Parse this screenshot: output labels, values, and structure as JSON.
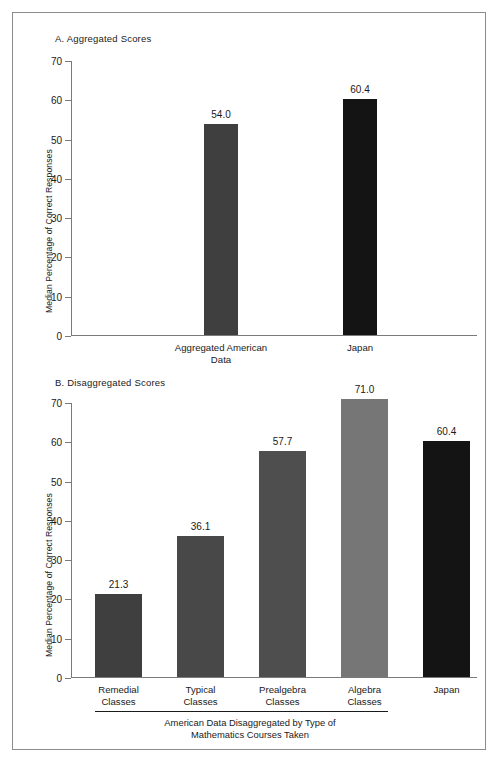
{
  "figure": {
    "border_color": "#8c8c8c",
    "axis_color": "#7a7a7a"
  },
  "chart_data": [
    {
      "type": "bar",
      "title": "A. Aggregated Scores",
      "xlabel": "",
      "ylabel": "Median Percentage of Correct Responses",
      "ylim": [
        0,
        70
      ],
      "yticks": [
        0,
        10,
        20,
        30,
        40,
        50,
        60,
        70
      ],
      "ytick_labels": [
        "0",
        "10",
        "20",
        "30",
        "40",
        "50",
        "60",
        "70"
      ],
      "grid": false,
      "legend": "none",
      "categories": [
        "Aggregated American Data",
        "Japan"
      ],
      "category_lines": [
        [
          "Aggregated American",
          "Data"
        ],
        [
          "Japan"
        ]
      ],
      "values": [
        54.0,
        60.4
      ],
      "value_labels": [
        "54.0",
        "60.4"
      ],
      "bar_colors": [
        "#3f3f3f",
        "#141414"
      ]
    },
    {
      "type": "bar",
      "title": "B. Disaggregated Scores",
      "xlabel": "American Data Disaggregated by Type of Mathematics Courses Taken",
      "xlabel_lines": [
        "American Data Disaggregated by Type of",
        "Mathematics Courses Taken"
      ],
      "ylabel": "Median Percentage of Correct Responses",
      "ylim": [
        0,
        70
      ],
      "yticks": [
        0,
        10,
        20,
        30,
        40,
        50,
        60,
        70
      ],
      "ytick_labels": [
        "0",
        "10",
        "20",
        "30",
        "40",
        "50",
        "60",
        "70"
      ],
      "grid": false,
      "legend": "none",
      "categories": [
        "Remedial Classes",
        "Typical Classes",
        "Prealgebra Classes",
        "Algebra Classes",
        "Japan"
      ],
      "category_lines": [
        [
          "Remedial",
          "Classes"
        ],
        [
          "Typical",
          "Classes"
        ],
        [
          "Prealgebra",
          "Classes"
        ],
        [
          "Algebra",
          "Classes"
        ],
        [
          "Japan"
        ]
      ],
      "values": [
        21.3,
        36.1,
        57.7,
        71.0,
        60.4
      ],
      "value_labels": [
        "21.3",
        "36.1",
        "57.7",
        "71.0",
        "60.4"
      ],
      "bar_colors": [
        "#3f3f3f",
        "#484848",
        "#4e4e4e",
        "#767676",
        "#141414"
      ]
    }
  ]
}
